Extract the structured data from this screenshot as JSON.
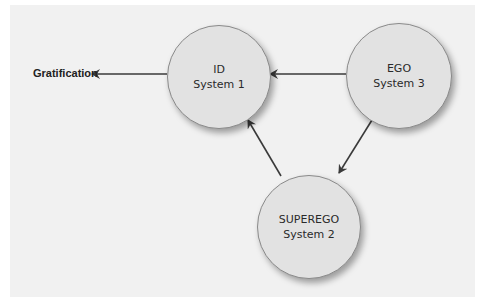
{
  "diagram": {
    "nodes": [
      {
        "id": "id",
        "title": "ID",
        "subtitle": "System 1"
      },
      {
        "id": "ego",
        "title": "EGO",
        "subtitle": "System 3"
      },
      {
        "id": "superego",
        "title": "SUPEREGO",
        "subtitle": "System 2"
      }
    ],
    "output_label": "Gratification",
    "edges": [
      {
        "from": "ID",
        "to": "Gratification"
      },
      {
        "from": "EGO",
        "to": "ID"
      },
      {
        "from": "EGO",
        "to": "SUPEREGO"
      },
      {
        "from": "SUPEREGO",
        "to": "ID"
      }
    ],
    "colors": {
      "background": "#f1f1f1",
      "node_fill": "#e2e2e2",
      "arrow": "#3a3a3a"
    }
  }
}
